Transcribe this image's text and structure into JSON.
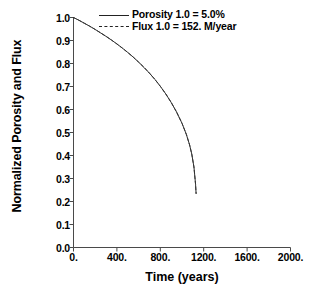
{
  "chart_data": {
    "type": "line",
    "title": "",
    "xlabel": "Time (years)",
    "ylabel": "Normalized Porosity and Flux",
    "xlim": [
      0,
      2000
    ],
    "ylim": [
      0.0,
      1.0
    ],
    "grid": false,
    "legend_position": "top-center",
    "xticks": [
      "0.",
      "400.",
      "800.",
      "1200.",
      "1600.",
      "2000."
    ],
    "xtick_values": [
      0,
      400,
      800,
      1200,
      1600,
      2000
    ],
    "yticks": [
      "0.0",
      "0.1",
      "0.2",
      "0.3",
      "0.4",
      "0.5",
      "0.6",
      "0.7",
      "0.8",
      "0.9",
      "1.0"
    ],
    "ytick_values": [
      0.0,
      0.1,
      0.2,
      0.3,
      0.4,
      0.5,
      0.6,
      0.7,
      0.8,
      0.9,
      1.0
    ],
    "series": [
      {
        "name": "Porosity 1.0 = 5.0%",
        "style": "solid",
        "color": "#333333",
        "x": [
          0,
          50,
          100,
          150,
          200,
          250,
          300,
          350,
          400,
          450,
          500,
          550,
          600,
          650,
          700,
          750,
          800,
          850,
          900,
          950,
          1000,
          1040,
          1070,
          1090,
          1110,
          1125,
          1130
        ],
        "y": [
          1.0,
          0.988,
          0.975,
          0.962,
          0.948,
          0.933,
          0.918,
          0.902,
          0.885,
          0.867,
          0.848,
          0.828,
          0.806,
          0.783,
          0.758,
          0.731,
          0.701,
          0.668,
          0.631,
          0.589,
          0.54,
          0.492,
          0.446,
          0.406,
          0.35,
          0.275,
          0.235
        ]
      },
      {
        "name": "Flux 1.0 = 152. M/year",
        "style": "dashed",
        "color": "#333333",
        "x": [
          0,
          50,
          100,
          150,
          200,
          250,
          300,
          350,
          400,
          450,
          500,
          550,
          600,
          650,
          700,
          750,
          800,
          850,
          900,
          950,
          1000,
          1040,
          1070,
          1090,
          1110,
          1125,
          1130
        ],
        "y": [
          1.0,
          0.988,
          0.975,
          0.962,
          0.948,
          0.933,
          0.918,
          0.902,
          0.885,
          0.867,
          0.848,
          0.828,
          0.806,
          0.783,
          0.758,
          0.731,
          0.701,
          0.668,
          0.631,
          0.589,
          0.54,
          0.492,
          0.446,
          0.406,
          0.35,
          0.275,
          0.235
        ]
      }
    ]
  },
  "legend": [
    {
      "label": "Porosity 1.0 = 5.0%",
      "style": "solid"
    },
    {
      "label": "Flux 1.0 = 152. M/year",
      "style": "dashed"
    }
  ],
  "axes": {
    "x_title": "Time (years)",
    "y_title": "Normalized Porosity and Flux"
  },
  "colors": {
    "axis": "#4a4a4a",
    "curve": "#555555",
    "text": "#000000",
    "background": "#ffffff"
  }
}
